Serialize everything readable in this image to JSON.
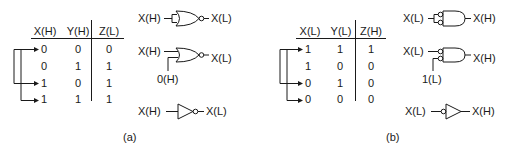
{
  "panel_a": {
    "caption": "(a)",
    "table": {
      "headers": [
        "X(H)",
        "Y(H)",
        "Z(L)"
      ],
      "rows": [
        [
          "0",
          "0",
          "0"
        ],
        [
          "0",
          "1",
          "1"
        ],
        [
          "1",
          "0",
          "1"
        ],
        [
          "1",
          "1",
          "1"
        ]
      ],
      "arrowed_rows": [
        0,
        2,
        3
      ]
    },
    "gates": [
      {
        "type": "NOR with tied inputs",
        "input": "X(H)",
        "output": "X(L)"
      },
      {
        "type": "NOR with one input tied low",
        "input": "X(H)",
        "tie_input": "0(H)",
        "output": "X(L)"
      },
      {
        "type": "inverter",
        "input": "X(H)",
        "output": "X(L)"
      }
    ]
  },
  "panel_b": {
    "caption": "(b)",
    "table": {
      "headers": [
        "X(L)",
        "Y(L)",
        "Z(H)"
      ],
      "rows": [
        [
          "1",
          "1",
          "1"
        ],
        [
          "1",
          "0",
          "0"
        ],
        [
          "0",
          "1",
          "0"
        ],
        [
          "0",
          "0",
          "0"
        ]
      ],
      "arrowed_rows": [
        0,
        2,
        3
      ]
    },
    "gates": [
      {
        "type": "AND with active-low tied inputs",
        "input": "X(L)",
        "output": "X(H)"
      },
      {
        "type": "AND with active-low inputs, one tied",
        "input": "X(L)",
        "tie_input": "1(L)",
        "output": "X(H)"
      },
      {
        "type": "inverter with active-low input",
        "input": "X(L)",
        "output": "X(H)"
      }
    ]
  }
}
